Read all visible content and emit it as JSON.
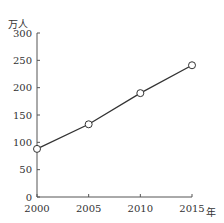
{
  "chart_data": {
    "type": "line",
    "title": "",
    "xlabel": "年",
    "ylabel": "万人",
    "categories": [
      "2000",
      "2005",
      "2010",
      "2015"
    ],
    "x": [
      2000,
      2005,
      2010,
      2015
    ],
    "series": [
      {
        "name": "",
        "values": [
          88,
          133,
          190,
          241
        ]
      }
    ],
    "ylim": [
      0,
      300
    ],
    "yticks": [
      0,
      50,
      100,
      150,
      200,
      250,
      300
    ],
    "xticks": [
      2000,
      2005,
      2010,
      2015
    ],
    "grid": false,
    "legend": "none",
    "line_color": "#333333",
    "marker": "open-circle"
  }
}
